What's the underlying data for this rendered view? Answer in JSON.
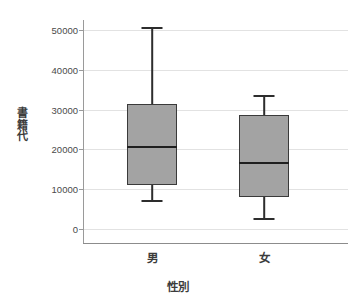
{
  "chart_data": {
    "type": "box",
    "title": "",
    "xlabel": "性別",
    "ylabel": "書籍代",
    "categories": [
      "男",
      "女"
    ],
    "ylim": [
      0,
      52000
    ],
    "yticks": [
      0,
      10000,
      20000,
      30000,
      40000,
      50000
    ],
    "ytick_labels": [
      "0",
      "10000",
      "20000",
      "30000",
      "40000",
      "50000"
    ],
    "grid": true,
    "legend": "none",
    "box_color": "#a3a3a3",
    "line_color": "#2d2d2d",
    "grid_color": "#e2e2e2",
    "boxes": [
      {
        "category": "男",
        "whisker_low": 7300,
        "q1": 11050,
        "median": 20600,
        "q3": 31400,
        "whisker_high": 50700
      },
      {
        "category": "女",
        "whisker_low": 2800,
        "q1": 8050,
        "median": 16600,
        "q3": 28600,
        "whisker_high": 33700
      }
    ]
  },
  "axes": {
    "y_title_chars": [
      "書",
      "籍",
      "代"
    ],
    "x_title": "性別"
  }
}
